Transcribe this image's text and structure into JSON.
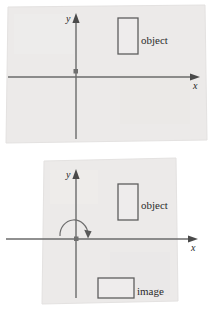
{
  "figure": {
    "name": "reflection-of-object-across-x-axis",
    "background_color": "#ffffff",
    "panel_fill": "#eceaea",
    "line_color": "#595959",
    "text_color": "#2b2b2b",
    "panels": [
      {
        "id": "panel-top",
        "name": "object-only-coordinate-plane",
        "axes": {
          "x_label": "x",
          "y_label": "y"
        },
        "shapes": [
          {
            "name": "object-rectangle",
            "label": "object",
            "orientation": "portrait"
          }
        ],
        "markers": [
          {
            "name": "origin-point",
            "label": ""
          }
        ]
      },
      {
        "id": "panel-bottom",
        "name": "object-and-image-coordinate-plane",
        "axes": {
          "x_label": "x",
          "y_label": "y"
        },
        "shapes": [
          {
            "name": "object-rectangle",
            "label": "object",
            "orientation": "portrait"
          },
          {
            "name": "image-rectangle",
            "label": "image",
            "orientation": "landscape"
          }
        ],
        "markers": [
          {
            "name": "origin-point",
            "label": ""
          },
          {
            "name": "rotation-arc-arrow",
            "label": ""
          }
        ]
      }
    ]
  }
}
